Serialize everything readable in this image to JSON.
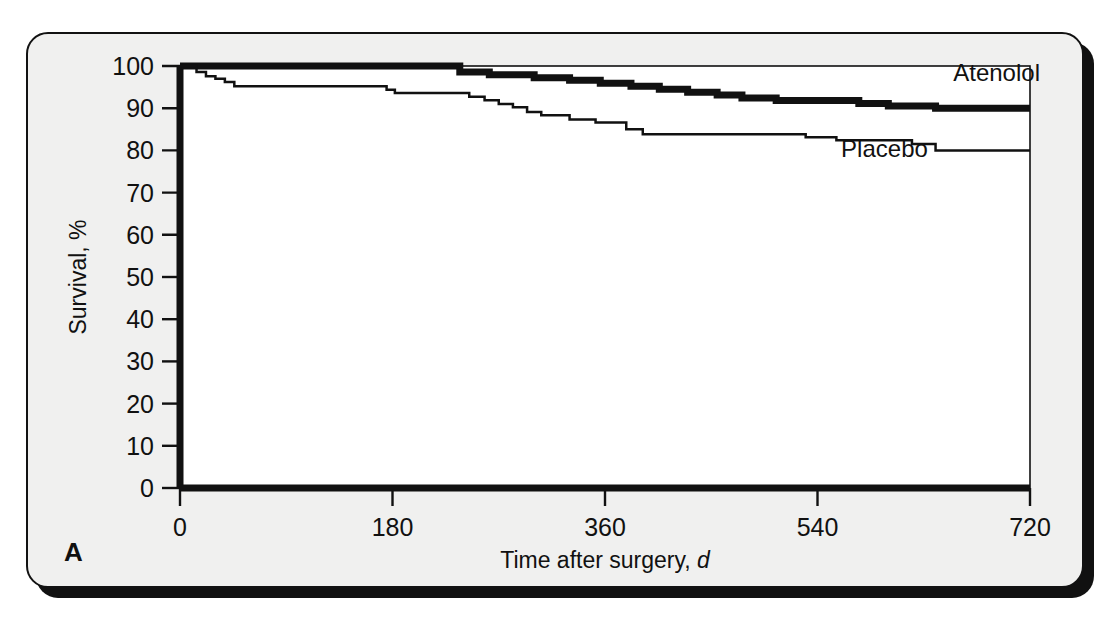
{
  "figure": {
    "panel_letter": "A",
    "background_color": "#f0f0ef",
    "ink_color": "#111111"
  },
  "chart_data": {
    "type": "line",
    "subtype": "kaplan-meier-step",
    "title": "",
    "xlabel_main": "Time after surgery, ",
    "xlabel_unit": "d",
    "ylabel": "Survival, %",
    "xlim": [
      0,
      720
    ],
    "ylim": [
      0,
      100
    ],
    "xticks": [
      0,
      180,
      360,
      540,
      720
    ],
    "xticklabels": [
      "0",
      "180",
      "360",
      "540",
      "720"
    ],
    "yticks": [
      0,
      10,
      20,
      30,
      40,
      50,
      60,
      70,
      80,
      90,
      100
    ],
    "yticklabels": [
      "0",
      "10",
      "20",
      "30",
      "40",
      "50",
      "60",
      "70",
      "80",
      "90",
      "100"
    ],
    "grid": false,
    "legend_position": "inline-annotation",
    "series": [
      {
        "name": "Atenolol",
        "line_style": "thick",
        "line_width_px": 7,
        "color": "#111111",
        "label_x": 655,
        "label_y": 96.5,
        "x": [
          0,
          237,
          237,
          262,
          262,
          300,
          300,
          330,
          330,
          356,
          356,
          382,
          382,
          406,
          406,
          430,
          430,
          455,
          455,
          476,
          476,
          505,
          505,
          540,
          540,
          575,
          575,
          600,
          600,
          640,
          640,
          720
        ],
        "y": [
          100,
          100,
          98.6,
          98.6,
          97.9,
          97.9,
          97.2,
          97.2,
          96.6,
          96.6,
          95.9,
          95.9,
          95.2,
          95.2,
          94.5,
          94.5,
          93.8,
          93.8,
          93.1,
          93.1,
          92.4,
          92.4,
          91.8,
          91.8,
          91.8,
          91.8,
          91.1,
          91.1,
          90.5,
          90.5,
          90.0,
          90.0
        ]
      },
      {
        "name": "Placebo",
        "line_style": "thin",
        "line_width_px": 2.5,
        "color": "#111111",
        "label_x": 560,
        "label_y": 78.5,
        "x": [
          0,
          14,
          14,
          22,
          22,
          30,
          30,
          38,
          38,
          46,
          46,
          175,
          175,
          182,
          182,
          245,
          245,
          258,
          258,
          270,
          270,
          282,
          282,
          294,
          294,
          306,
          306,
          330,
          330,
          352,
          352,
          378,
          378,
          392,
          392,
          530,
          530,
          556,
          556,
          620,
          620,
          640,
          640,
          720
        ],
        "y": [
          100,
          100,
          98.6,
          98.6,
          97.6,
          97.6,
          97.0,
          97.0,
          96.2,
          96.2,
          95.2,
          95.2,
          94.4,
          94.4,
          93.6,
          93.6,
          92.7,
          92.7,
          91.9,
          91.9,
          91.0,
          91.0,
          90.2,
          90.2,
          89.1,
          89.1,
          88.3,
          88.3,
          87.3,
          87.3,
          86.6,
          86.6,
          85.0,
          85.0,
          83.8,
          83.8,
          83.1,
          83.1,
          82.4,
          82.4,
          81.5,
          81.5,
          80.0,
          80.0
        ]
      }
    ]
  }
}
